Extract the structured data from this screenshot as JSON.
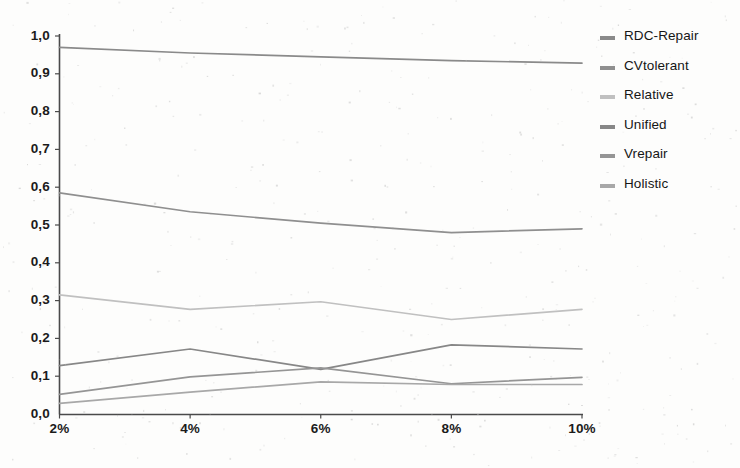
{
  "chart_data": {
    "type": "line",
    "title": "",
    "xlabel": "",
    "ylabel": "",
    "categories": [
      "2%",
      "4%",
      "6%",
      "8%",
      "10%"
    ],
    "x_tick_labels": [
      "2%",
      "4%",
      "6%",
      "8%",
      "10%"
    ],
    "y_tick_labels": [
      "0,0",
      "0,1",
      "0,2",
      "0,3",
      "0,4",
      "0,5",
      "0,6",
      "0,7",
      "0,8",
      "0,9",
      "1,0"
    ],
    "y_tick_values": [
      0.0,
      0.1,
      0.2,
      0.3,
      0.4,
      0.5,
      0.6,
      0.7,
      0.8,
      0.9,
      1.0
    ],
    "ylim": [
      0.0,
      1.0
    ],
    "grid": false,
    "legend_position": "right",
    "decimal_separator": ",",
    "series": [
      {
        "name": "RDC-Repair",
        "color": "#8a8a8a",
        "values": [
          0.97,
          0.955,
          0.945,
          0.935,
          0.928
        ]
      },
      {
        "name": "CVtolerant",
        "color": "#8f8f8f",
        "values": [
          0.585,
          0.535,
          0.505,
          0.48,
          0.49
        ]
      },
      {
        "name": "Relative",
        "color": "#c0c0c0",
        "values": [
          0.315,
          0.277,
          0.297,
          0.25,
          0.277
        ]
      },
      {
        "name": "Unified",
        "color": "#878787",
        "values": [
          0.128,
          0.172,
          0.118,
          0.183,
          0.172
        ]
      },
      {
        "name": "Vrepair",
        "color": "#959595",
        "values": [
          0.052,
          0.098,
          0.122,
          0.08,
          0.097
        ]
      },
      {
        "name": "Holistic",
        "color": "#a8a8a8",
        "values": [
          0.028,
          0.058,
          0.085,
          0.078,
          0.078
        ]
      }
    ]
  },
  "axis": {
    "line_color": "#4a4a4a"
  },
  "legend": {
    "entries": [
      {
        "label": "RDC-Repair"
      },
      {
        "label": "CVtolerant"
      },
      {
        "label": "Relative"
      },
      {
        "label": "Unified"
      },
      {
        "label": "Vrepair"
      },
      {
        "label": "Holistic"
      }
    ]
  }
}
